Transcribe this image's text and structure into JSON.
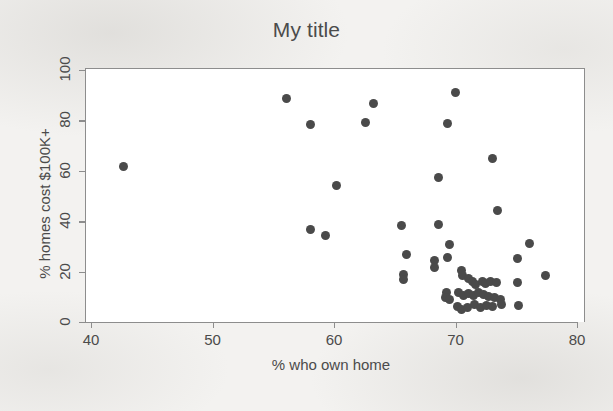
{
  "chart_data": {
    "type": "scatter",
    "title": "My title",
    "xlabel": "% who own home",
    "ylabel": "% homes cost $100K+",
    "xlim": [
      40,
      80
    ],
    "ylim": [
      0,
      100
    ],
    "xticks": [
      40,
      50,
      60,
      70,
      80
    ],
    "yticks": [
      0,
      20,
      40,
      60,
      80,
      100
    ],
    "grid": false,
    "legend": null,
    "marker": {
      "shape": "circle",
      "color": "#4a4a4a",
      "size_px": 9
    },
    "n_points": 56,
    "points": [
      {
        "x": 42.6,
        "y": 62.0
      },
      {
        "x": 56.0,
        "y": 89.0
      },
      {
        "x": 58.0,
        "y": 78.7
      },
      {
        "x": 62.5,
        "y": 79.5
      },
      {
        "x": 63.2,
        "y": 87.3
      },
      {
        "x": 69.9,
        "y": 91.3
      },
      {
        "x": 69.3,
        "y": 79.0
      },
      {
        "x": 73.0,
        "y": 65.3
      },
      {
        "x": 60.1,
        "y": 54.4
      },
      {
        "x": 68.5,
        "y": 57.6
      },
      {
        "x": 73.4,
        "y": 44.7
      },
      {
        "x": 65.5,
        "y": 38.8
      },
      {
        "x": 68.5,
        "y": 39.0
      },
      {
        "x": 58.0,
        "y": 37.0
      },
      {
        "x": 59.2,
        "y": 34.6
      },
      {
        "x": 69.4,
        "y": 31.3
      },
      {
        "x": 76.0,
        "y": 31.7
      },
      {
        "x": 65.9,
        "y": 27.3
      },
      {
        "x": 69.3,
        "y": 25.9
      },
      {
        "x": 68.2,
        "y": 25.0
      },
      {
        "x": 68.2,
        "y": 22.0
      },
      {
        "x": 75.0,
        "y": 25.5
      },
      {
        "x": 65.6,
        "y": 19.3
      },
      {
        "x": 65.6,
        "y": 17.2
      },
      {
        "x": 77.3,
        "y": 19.0
      },
      {
        "x": 70.4,
        "y": 20.7
      },
      {
        "x": 70.5,
        "y": 19.0
      },
      {
        "x": 71.0,
        "y": 17.6
      },
      {
        "x": 71.3,
        "y": 16.3
      },
      {
        "x": 71.6,
        "y": 15.2
      },
      {
        "x": 72.1,
        "y": 16.6
      },
      {
        "x": 72.4,
        "y": 15.5
      },
      {
        "x": 72.8,
        "y": 16.4
      },
      {
        "x": 73.3,
        "y": 16.0
      },
      {
        "x": 75.0,
        "y": 16.2
      },
      {
        "x": 69.2,
        "y": 12.0
      },
      {
        "x": 69.1,
        "y": 10.0
      },
      {
        "x": 69.4,
        "y": 9.4
      },
      {
        "x": 70.2,
        "y": 12.0
      },
      {
        "x": 70.6,
        "y": 11.0
      },
      {
        "x": 71.0,
        "y": 11.6
      },
      {
        "x": 71.4,
        "y": 11.1
      },
      {
        "x": 71.8,
        "y": 12.3
      },
      {
        "x": 72.2,
        "y": 11.4
      },
      {
        "x": 72.6,
        "y": 10.4
      },
      {
        "x": 73.1,
        "y": 10.0
      },
      {
        "x": 73.6,
        "y": 9.2
      },
      {
        "x": 70.1,
        "y": 6.6
      },
      {
        "x": 70.4,
        "y": 5.2
      },
      {
        "x": 70.9,
        "y": 6.0
      },
      {
        "x": 71.5,
        "y": 7.2
      },
      {
        "x": 72.0,
        "y": 6.3
      },
      {
        "x": 72.5,
        "y": 7.0
      },
      {
        "x": 73.0,
        "y": 6.4
      },
      {
        "x": 73.7,
        "y": 7.4
      },
      {
        "x": 75.1,
        "y": 7.0
      }
    ]
  }
}
